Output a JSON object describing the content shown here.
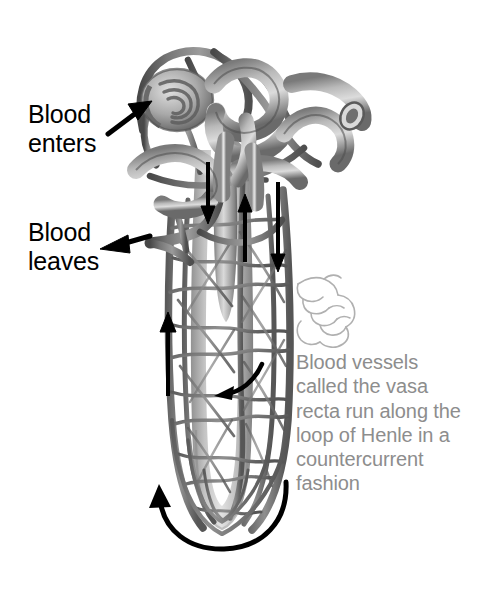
{
  "figure": {
    "background_color": "#ffffff",
    "width": 490,
    "height": 591
  },
  "labels": [
    {
      "name": "blood-enters",
      "line1": "Blood",
      "line2": "enters",
      "color": "#000000",
      "arrow": "arrow pointing up-right to afferent arteriole"
    },
    {
      "name": "blood-leaves",
      "line1": "Blood",
      "line2": "leaves",
      "color": "#000000",
      "arrow": "arrow pointing left away from efferent vessel"
    }
  ],
  "caption": {
    "color": "#8d8d8d",
    "lines": [
      "Blood vessels",
      "called the vasa",
      "recta run along the",
      "loop of Henle in a",
      "countercurrent",
      "fashion"
    ],
    "full_text": "Blood vessels called the vasa recta run along the loop of Henle in a countercurrent fashion"
  },
  "flow_arrows": [
    {
      "name": "descending-arrow-left",
      "direction": "down"
    },
    {
      "name": "ascending-arrow-middle",
      "direction": "up"
    },
    {
      "name": "descending-arrow-right",
      "direction": "down"
    },
    {
      "name": "ascending-arrow-outer-left",
      "direction": "up"
    },
    {
      "name": "loop-tip-curved-arrow",
      "direction": "counterclockwise-u-turn"
    },
    {
      "name": "inner-curved-arrow",
      "direction": "down-left"
    }
  ],
  "anatomy": {
    "colors": {
      "tubule_light": "#b4b4b4",
      "tubule_mid": "#9a9a9a",
      "vessel_dark": "#6e6e6e",
      "vessel_darker": "#585858",
      "outline": "#4a4a4a",
      "highlight": "#d8d8d8"
    },
    "parts": [
      "glomerulus",
      "afferent arteriole",
      "efferent arteriole",
      "proximal convoluted tubule",
      "distal convoluted tubule",
      "loop of Henle",
      "vasa recta capillary network",
      "collecting duct"
    ]
  },
  "pointer_hand": {
    "name": "pointing-hand-icon",
    "color": "#aaaaaa",
    "description": "light line drawing of a hand with index finger pointing left"
  }
}
